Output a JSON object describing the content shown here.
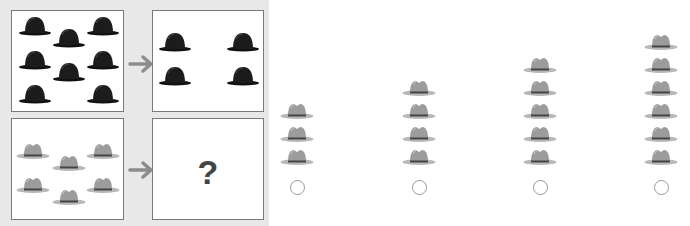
{
  "puzzle": {
    "question_mark": "?",
    "top_left": {
      "hat_type": "bowler-hat",
      "count": 8,
      "color": "#1a1a1a"
    },
    "top_right": {
      "hat_type": "bowler-hat",
      "count": 4,
      "color": "#1a1a1a"
    },
    "bottom_left": {
      "hat_type": "fedora-hat",
      "count": 6,
      "color": "#9a9a9a"
    },
    "arrow_color": "#8c8c8c"
  },
  "options": [
    {
      "hat_type": "fedora-hat",
      "count": 3,
      "selected": false
    },
    {
      "hat_type": "fedora-hat",
      "count": 4,
      "selected": false
    },
    {
      "hat_type": "fedora-hat",
      "count": 5,
      "selected": false
    },
    {
      "hat_type": "fedora-hat",
      "count": 6,
      "selected": false
    }
  ]
}
